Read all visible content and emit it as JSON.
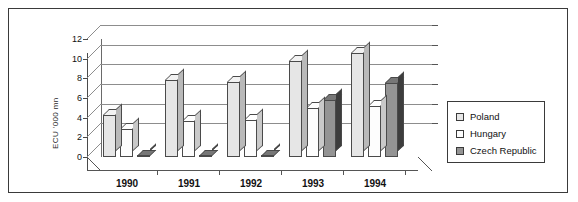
{
  "chart_data": {
    "type": "bar",
    "title": "",
    "subtitle": "",
    "xlabel": "",
    "ylabel": "ECU '000 mn",
    "categories": [
      "1990",
      "1991",
      "1992",
      "1993",
      "1994"
    ],
    "series": [
      {
        "name": "Poland",
        "values": [
          4.3,
          7.8,
          7.6,
          9.8,
          10.6
        ],
        "color": "#e6e6e6"
      },
      {
        "name": "Hungary",
        "values": [
          2.8,
          3.7,
          3.8,
          5.0,
          5.2
        ],
        "color": "#fdfdfd"
      },
      {
        "name": "Czech Republic",
        "values": [
          0.1,
          0.1,
          0.1,
          5.8,
          7.5
        ],
        "color": "#949494"
      }
    ],
    "ylim": [
      0,
      12
    ],
    "yticks": [
      "0",
      "2",
      "4",
      "6",
      "8",
      "10",
      "12"
    ],
    "grid": true,
    "legend_position": "right",
    "style": "3d-clustered-column"
  },
  "legend": {
    "items": [
      {
        "label": "Poland"
      },
      {
        "label": "Hungary"
      },
      {
        "label": "Czech Republic"
      }
    ]
  }
}
